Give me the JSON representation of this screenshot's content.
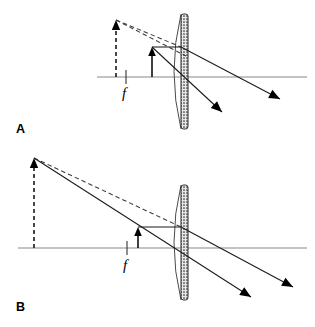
{
  "figure": {
    "width": 315,
    "height": 327,
    "background_color": "#ffffff",
    "ink_color": "#000000",
    "axis_color": "#888888"
  },
  "panels": [
    {
      "id": "A",
      "label": "A",
      "label_pos": {
        "x": 16,
        "y": 133
      },
      "description": "Object close to diverging lens; small upright virtual image",
      "optical_axis": {
        "x1": 97,
        "y": 77,
        "x2": 307
      },
      "lens": {
        "name": "diverging-lens",
        "center_x": 181,
        "top_y": 14,
        "bottom_y": 129,
        "bulge": 14,
        "bar_width": 7,
        "fill_pattern": "stipple"
      },
      "focal_tick": {
        "x": 126,
        "y_top": 70,
        "y_bottom": 84
      },
      "focal_label": {
        "text": "f",
        "x": 122,
        "y": 98
      },
      "object_arrow": {
        "name": "object-arrow",
        "x": 152,
        "base_y": 77,
        "tip_y": 47,
        "style": "solid"
      },
      "image_arrow": {
        "name": "virtual-image-arrow",
        "x": 116,
        "base_y": 77,
        "tip_y": 20,
        "style": "dashed"
      },
      "rays": [
        {
          "name": "parallel-ray",
          "style": "solid",
          "points": [
            [
              152,
              47
            ],
            [
              181,
              47
            ]
          ]
        },
        {
          "name": "refracted-parallel-ray",
          "style": "solid",
          "points": [
            [
              181,
              47
            ],
            [
              280,
              99
            ]
          ]
        },
        {
          "name": "center-ray",
          "style": "solid",
          "points": [
            [
              152,
              47
            ],
            [
              222,
              112
            ]
          ]
        },
        {
          "name": "virtual-extension-upper",
          "style": "dashed",
          "points": [
            [
              116,
              20
            ],
            [
              181,
              47
            ]
          ]
        },
        {
          "name": "virtual-extension-lower",
          "style": "dashed",
          "points": [
            [
              116,
              20
            ],
            [
              186,
              56
            ]
          ]
        }
      ],
      "ray_arrowheads": [
        {
          "name": "ray-arrowhead-1",
          "x": 280,
          "y": 99,
          "angle_deg": 27.7
        },
        {
          "name": "ray-arrowhead-2",
          "x": 222,
          "y": 112,
          "angle_deg": 42.9
        }
      ]
    },
    {
      "id": "B",
      "label": "B",
      "label_pos": {
        "x": 16,
        "y": 311
      },
      "description": "Object farther from diverging lens; large upright virtual image",
      "optical_axis": {
        "x1": 18,
        "y": 248,
        "x2": 307
      },
      "lens": {
        "name": "diverging-lens",
        "center_x": 181,
        "top_y": 185,
        "bottom_y": 300,
        "bulge": 14,
        "bar_width": 7,
        "fill_pattern": "stipple"
      },
      "focal_tick": {
        "x": 127,
        "y_top": 241,
        "y_bottom": 255
      },
      "focal_label": {
        "text": "f",
        "x": 123,
        "y": 270
      },
      "object_arrow": {
        "name": "object-arrow",
        "x": 138,
        "base_y": 248,
        "tip_y": 227,
        "style": "solid"
      },
      "image_arrow": {
        "name": "virtual-image-arrow",
        "x": 34,
        "base_y": 248,
        "tip_y": 158,
        "style": "dashed"
      },
      "rays": [
        {
          "name": "parallel-ray",
          "style": "solid",
          "points": [
            [
              138,
              227
            ],
            [
              181,
              227
            ]
          ]
        },
        {
          "name": "refracted-parallel-ray",
          "style": "solid",
          "points": [
            [
              181,
              227
            ],
            [
              293,
              287
            ]
          ]
        },
        {
          "name": "center-ray",
          "style": "solid",
          "points": [
            [
              34,
              158
            ],
            [
              251,
              297
            ]
          ]
        },
        {
          "name": "virtual-extension-upper",
          "style": "dashed",
          "points": [
            [
              34,
              158
            ],
            [
              181,
              227
            ]
          ]
        }
      ],
      "ray_arrowheads": [
        {
          "name": "ray-arrowhead-1",
          "x": 293,
          "y": 287,
          "angle_deg": 28.2
        },
        {
          "name": "ray-arrowhead-2",
          "x": 251,
          "y": 297,
          "angle_deg": 32.6
        }
      ]
    }
  ],
  "legend": {
    "solid_meaning": "actual light ray",
    "dashed_meaning": "virtual ray extension / virtual image",
    "focal_symbol": "f"
  }
}
